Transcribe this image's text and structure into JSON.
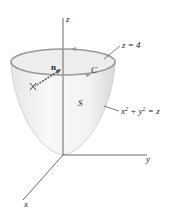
{
  "figure": {
    "axes": {
      "z_label": "z",
      "y_label": "y",
      "x_label": "x"
    },
    "labels": {
      "normal": "n",
      "curve": "C",
      "plane": "z = 4",
      "surface": "S",
      "equation_base": "x",
      "equation_exp1": "2",
      "equation_plus": " + y",
      "equation_exp2": "2",
      "equation_rest": " = z"
    },
    "colors": {
      "surface_fill": "#f2f2f2",
      "surface_edge": "#c8c8c8",
      "rim": "#9a9a9a",
      "axis": "#444444",
      "text": "#222222"
    }
  }
}
